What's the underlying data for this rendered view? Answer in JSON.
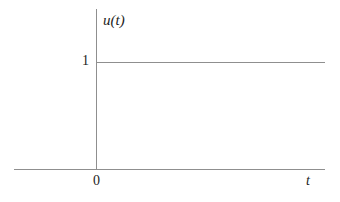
{
  "figure": {
    "name": "unit-step-function-plot",
    "background_color": "#ffffff",
    "line_color": "#8f8f8f",
    "text_color": "#1d1d1d"
  },
  "labels": {
    "y_axis_label": "u(t)",
    "x_axis_label": "t",
    "origin_label": "0",
    "y_tick_label": "1"
  },
  "chart_data": {
    "type": "line",
    "title": "",
    "xlabel": "t",
    "ylabel": "u(t)",
    "xlim": [
      -0.35,
      1.0
    ],
    "ylim": [
      0,
      1.4
    ],
    "grid": false,
    "legend": null,
    "x_ticks": [
      0
    ],
    "x_tick_labels": [
      "0"
    ],
    "y_ticks": [
      1
    ],
    "y_tick_labels": [
      "1"
    ],
    "series": [
      {
        "name": "u(t)",
        "x": [
          0,
          1.0
        ],
        "values": [
          1,
          1
        ]
      }
    ],
    "annotations": []
  }
}
